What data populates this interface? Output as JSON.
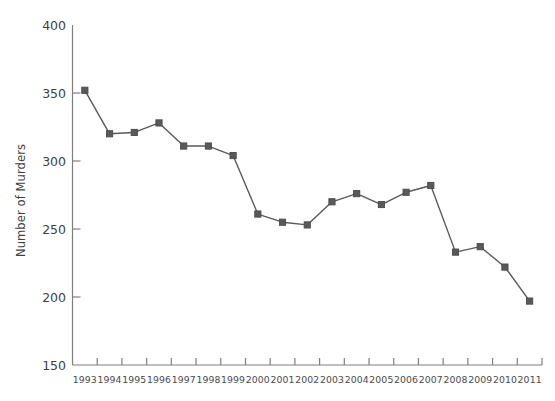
{
  "chart_data": {
    "type": "line",
    "title": "",
    "subtitle": "",
    "xlabel": "",
    "ylabel": "Number of Murders",
    "categories": [
      "1993",
      "1994",
      "1995",
      "1996",
      "1997",
      "1998",
      "1999",
      "2000",
      "2001",
      "2002",
      "2003",
      "2004",
      "2005",
      "2006",
      "2007",
      "2008",
      "2009",
      "2010",
      "2011"
    ],
    "values": [
      352,
      320,
      321,
      328,
      311,
      311,
      304,
      261,
      255,
      253,
      270,
      276,
      268,
      277,
      282,
      233,
      237,
      222,
      197
    ],
    "series": [
      {
        "name": "Number of Murders",
        "values": [
          352,
          320,
          321,
          328,
          311,
          311,
          304,
          261,
          255,
          253,
          270,
          276,
          268,
          277,
          282,
          233,
          237,
          222,
          197
        ]
      }
    ],
    "ylim": [
      150,
      400
    ],
    "yticks": [
      150,
      200,
      250,
      300,
      350,
      400
    ],
    "ytick_labels": [
      "150",
      "200",
      "250",
      "300",
      "350",
      "400"
    ],
    "xtick_labels": [
      "1993",
      "1994",
      "1995",
      "1996",
      "1997",
      "1998",
      "1999",
      "2000",
      "2001",
      "2002",
      "2003",
      "2004",
      "2005",
      "2006",
      "2007",
      "2008",
      "2009",
      "2010",
      "2011"
    ],
    "grid": false,
    "legend": false,
    "legend_position": "none",
    "marker": "square",
    "line_color": "#595959",
    "marker_color": "#595959",
    "axis_color": "#7f7f7f",
    "text_color": "#3f3f3f",
    "background_color": "#ffffff"
  }
}
